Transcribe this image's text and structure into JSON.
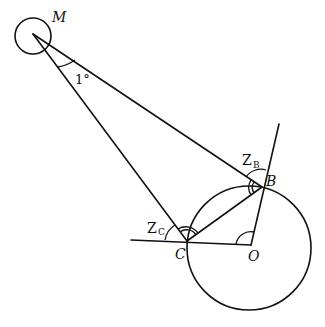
{
  "diagram": {
    "type": "geometry",
    "points": {
      "M": {
        "label": "M",
        "x": 33,
        "y": 34
      },
      "B": {
        "label": "B",
        "x": 262,
        "y": 187
      },
      "C": {
        "label": "C",
        "x": 187,
        "y": 241
      },
      "O": {
        "label": "O",
        "x": 251,
        "y": 245
      }
    },
    "angle_labels": {
      "M_angle": "1°",
      "Z_B": {
        "main": "Z",
        "sub": "B"
      },
      "Z_C": {
        "main": "Z",
        "sub": "C"
      }
    },
    "circles": [
      {
        "name": "small-circle-M",
        "cx": 33,
        "cy": 36,
        "r": 18
      },
      {
        "name": "large-circle-O",
        "cx": 249,
        "cy": 248,
        "r": 62
      }
    ]
  }
}
